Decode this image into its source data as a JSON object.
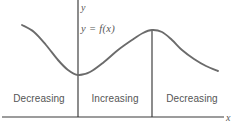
{
  "figure": {
    "type": "math-graph",
    "axis_labels": {
      "x": "x",
      "y": "y"
    },
    "curve_label": "y = f(x)",
    "regions": [
      {
        "id": "decreasing-left",
        "label": "Decreasing"
      },
      {
        "id": "increasing",
        "label": "Increasing"
      },
      {
        "id": "decreasing-right",
        "label": "Decreasing"
      }
    ],
    "colors": {
      "curve": "#6b6b6b",
      "axis": "#3a3a3a",
      "text": "#555555",
      "background": "#ffffff"
    }
  },
  "chart_data": {
    "type": "line",
    "title": "",
    "xlabel": "x",
    "ylabel": "y",
    "grid": false,
    "legend": null,
    "annotations": [
      {
        "text": "y = f(x)",
        "x": 81,
        "y": 31
      },
      {
        "text": "Decreasing",
        "x": 39,
        "y": 101
      },
      {
        "text": "Increasing",
        "x": 115,
        "y": 101
      },
      {
        "text": "Decreasing",
        "x": 192,
        "y": 101
      }
    ],
    "series": [
      {
        "name": "f(x)",
        "points": [
          [
            22,
            25
          ],
          [
            34,
            32
          ],
          [
            46,
            45
          ],
          [
            58,
            60
          ],
          [
            68,
            70
          ],
          [
            78,
            75
          ],
          [
            90,
            72
          ],
          [
            104,
            62
          ],
          [
            118,
            50
          ],
          [
            132,
            40
          ],
          [
            143,
            33
          ],
          [
            152,
            30
          ],
          [
            162,
            32
          ],
          [
            172,
            40
          ],
          [
            182,
            50
          ],
          [
            194,
            59
          ],
          [
            206,
            66
          ],
          [
            218,
            71
          ]
        ]
      }
    ],
    "vertical_markers": [
      {
        "label": "y-axis",
        "x": 78,
        "y_top": 0,
        "y_bottom": 117
      },
      {
        "label": "critical-point",
        "x": 152,
        "y_top": 30,
        "y_bottom": 117
      }
    ],
    "horizontal_axis": {
      "y": 117,
      "x_start": 2,
      "x_end": 224
    }
  }
}
